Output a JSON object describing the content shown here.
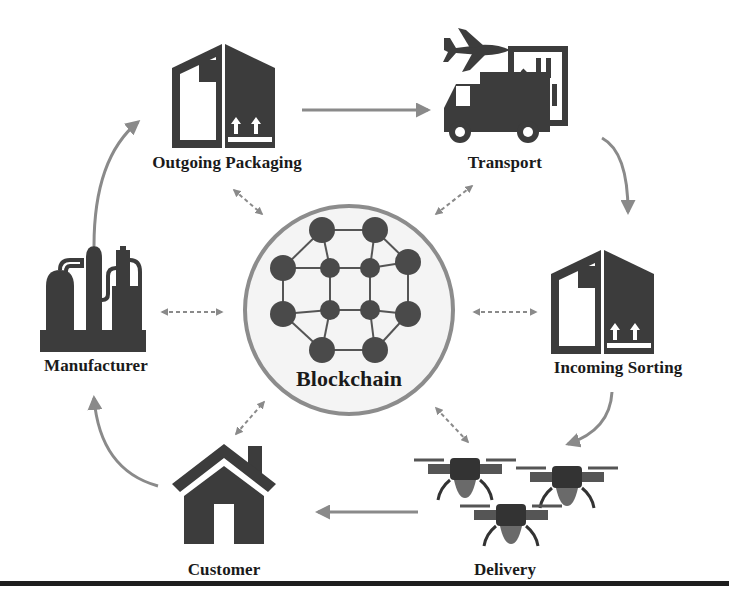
{
  "diagram": {
    "center": {
      "label": "Blockchain",
      "icon": "network-nodes-icon"
    },
    "nodes": [
      {
        "id": "outgoing_packaging",
        "label": "Outgoing Packaging",
        "icon": "box-icon"
      },
      {
        "id": "transport",
        "label": "Transport",
        "icon": "truck-plane-icon"
      },
      {
        "id": "incoming_sorting",
        "label": "Incoming Sorting",
        "icon": "box-icon"
      },
      {
        "id": "delivery",
        "label": "Delivery",
        "icon": "drones-icon"
      },
      {
        "id": "customer",
        "label": "Customer",
        "icon": "house-icon"
      },
      {
        "id": "manufacturer",
        "label": "Manufacturer",
        "icon": "factory-icon"
      }
    ],
    "flow": [
      [
        "Manufacturer",
        "Outgoing Packaging"
      ],
      [
        "Outgoing Packaging",
        "Transport"
      ],
      [
        "Transport",
        "Incoming Sorting"
      ],
      [
        "Incoming Sorting",
        "Delivery"
      ],
      [
        "Delivery",
        "Customer"
      ],
      [
        "Customer",
        "Manufacturer"
      ]
    ],
    "bidirectional_links_to_center": [
      "Outgoing Packaging",
      "Transport",
      "Incoming Sorting",
      "Delivery",
      "Customer",
      "Manufacturer"
    ],
    "colors": {
      "icon": "#3c3c3c",
      "arrow": "#8a8a8a",
      "circle_border": "#8c8c8c",
      "circle_fill": "#f3f3f3",
      "text": "#1a1a1a",
      "rule": "#1e1e1e"
    }
  }
}
